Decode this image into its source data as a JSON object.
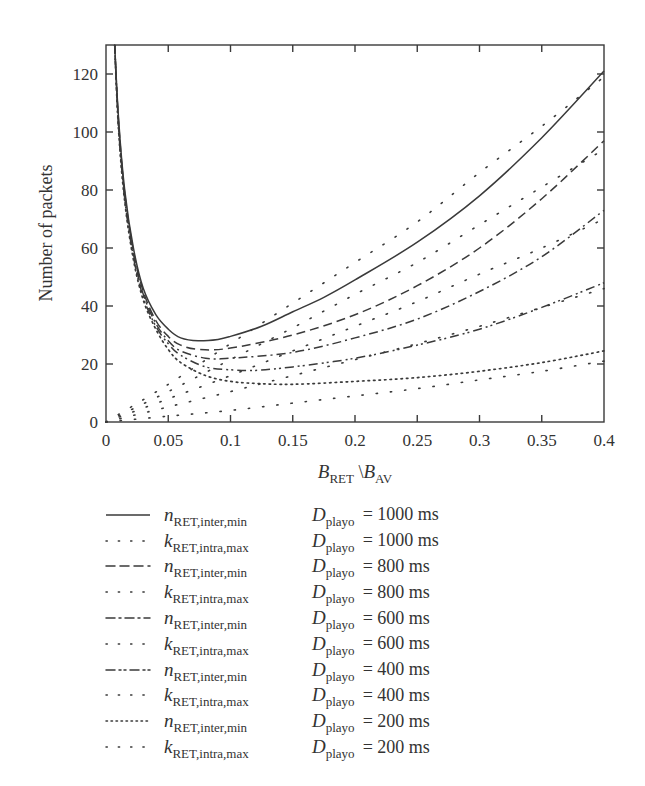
{
  "chart_data": {
    "type": "line",
    "title": "",
    "xlabel": "B_RET \\ B_AV",
    "xlabel_parts": {
      "b1": "B",
      "s1": "RET",
      "sep": " \\",
      "b2": "B",
      "s2": "AV"
    },
    "ylabel": "Number of packets",
    "xlim": [
      0,
      0.4
    ],
    "ylim": [
      0,
      130
    ],
    "x_ticks": [
      0,
      0.05,
      0.1,
      0.15,
      0.2,
      0.25,
      0.3,
      0.35,
      0.4
    ],
    "x_tick_labels": [
      "0",
      "0.05",
      "0.1",
      "0.15",
      "0.2",
      "0.25",
      "0.3",
      "0.35",
      "0.4"
    ],
    "y_ticks": [
      0,
      20,
      40,
      60,
      80,
      100,
      120
    ],
    "y_tick_labels": [
      "0",
      "20",
      "40",
      "60",
      "80",
      "100",
      "120"
    ],
    "grid": false,
    "legend_position": "below",
    "series": [
      {
        "name": "n_RET,inter,min D_playo = 1000 ms",
        "style": "solid",
        "x": [
          0.007,
          0.01,
          0.015,
          0.022,
          0.03,
          0.04,
          0.05,
          0.06,
          0.074,
          0.09,
          0.1,
          0.125,
          0.15,
          0.175,
          0.2,
          0.25,
          0.3,
          0.35,
          0.4
        ],
        "y": [
          130,
          105,
          80,
          60,
          46,
          37,
          32,
          29,
          28,
          28.5,
          29.5,
          33,
          38,
          43,
          49,
          62,
          78,
          98,
          121
        ]
      },
      {
        "name": "k_RET,intra,max D_playo = 1000 ms",
        "style": "sparse-dot",
        "x": [
          0,
          0.05,
          0.1,
          0.15,
          0.2,
          0.25,
          0.3,
          0.35,
          0.4
        ],
        "y": [
          0,
          13,
          27,
          41,
          55,
          69,
          86,
          102,
          119
        ]
      },
      {
        "name": "n_RET,inter,min D_playo = 800 ms",
        "style": "dashed",
        "x": [
          0.007,
          0.01,
          0.015,
          0.022,
          0.03,
          0.04,
          0.05,
          0.06,
          0.075,
          0.1,
          0.15,
          0.2,
          0.25,
          0.3,
          0.35,
          0.4
        ],
        "y": [
          130,
          104,
          79,
          59,
          45,
          35,
          29.5,
          26.5,
          25,
          25.5,
          30,
          37,
          47,
          60,
          77,
          97
        ]
      },
      {
        "name": "k_RET,intra,max D_playo = 800 ms",
        "style": "sparse-dot",
        "x": [
          0,
          0.05,
          0.1,
          0.15,
          0.2,
          0.25,
          0.3,
          0.35,
          0.4
        ],
        "y": [
          0,
          10.5,
          21.5,
          32.5,
          44,
          55,
          68,
          81,
          94
        ]
      },
      {
        "name": "n_RET,inter,min D_playo = 600 ms",
        "style": "dash-dot",
        "x": [
          0.007,
          0.01,
          0.015,
          0.022,
          0.03,
          0.04,
          0.05,
          0.06,
          0.08,
          0.1,
          0.15,
          0.2,
          0.25,
          0.3,
          0.35,
          0.4
        ],
        "y": [
          130,
          103,
          78,
          58,
          44,
          34,
          28,
          24.5,
          22,
          22,
          24,
          29,
          35.5,
          45,
          57,
          73
        ]
      },
      {
        "name": "k_RET,intra,max D_playo = 600 ms",
        "style": "sparse-dot",
        "x": [
          0,
          0.05,
          0.1,
          0.15,
          0.2,
          0.25,
          0.3,
          0.35,
          0.4
        ],
        "y": [
          0,
          8,
          16,
          24.5,
          33,
          41.5,
          51,
          60,
          70
        ]
      },
      {
        "name": "n_RET,inter,min D_playo = 400 ms",
        "style": "dash-dot-dot",
        "x": [
          0.007,
          0.01,
          0.015,
          0.022,
          0.03,
          0.04,
          0.05,
          0.06,
          0.08,
          0.1,
          0.12,
          0.15,
          0.2,
          0.25,
          0.3,
          0.35,
          0.4
        ],
        "y": [
          130,
          102,
          77,
          57,
          43,
          33,
          27,
          23,
          19,
          18,
          17.8,
          19,
          22,
          26.5,
          32,
          39.5,
          48
        ]
      },
      {
        "name": "k_RET,intra,max D_playo = 400 ms",
        "style": "sparse-dot",
        "x": [
          0,
          0.05,
          0.1,
          0.15,
          0.2,
          0.25,
          0.3,
          0.35,
          0.4
        ],
        "y": [
          0,
          5.2,
          10.5,
          16,
          21.5,
          27,
          33,
          39.5,
          46
        ]
      },
      {
        "name": "n_RET,inter,min D_playo = 200 ms",
        "style": "dotted",
        "x": [
          0.007,
          0.01,
          0.015,
          0.022,
          0.03,
          0.04,
          0.05,
          0.06,
          0.08,
          0.1,
          0.12,
          0.15,
          0.2,
          0.25,
          0.3,
          0.35,
          0.4
        ],
        "y": [
          130,
          101,
          76,
          56,
          42,
          32,
          25,
          20.5,
          16,
          14,
          13.3,
          13,
          14,
          15.3,
          17.5,
          20.5,
          24.5
        ]
      },
      {
        "name": "k_RET,intra,max D_playo = 200 ms",
        "style": "sparse-dot",
        "x": [
          0,
          0.05,
          0.1,
          0.15,
          0.2,
          0.25,
          0.3,
          0.35,
          0.4
        ],
        "y": [
          0,
          2,
          4,
          6.5,
          9,
          11.5,
          14.5,
          17.5,
          21
        ]
      }
    ]
  },
  "legend": {
    "items": [
      {
        "style": "solid",
        "sym": "n",
        "sub": "RET,inter,min",
        "d": "D",
        "dsub": "playo",
        "value": "= 1000 ms"
      },
      {
        "style": "sparse-dot",
        "sym": "k",
        "sub": "RET,intra,max",
        "d": "D",
        "dsub": "playo",
        "value": "= 1000 ms"
      },
      {
        "style": "dashed",
        "sym": "n",
        "sub": "RET,inter,min",
        "d": "D",
        "dsub": "playo",
        "value": "= 800 ms"
      },
      {
        "style": "sparse-dot",
        "sym": "k",
        "sub": "RET,intra,max",
        "d": "D",
        "dsub": "playo",
        "value": "= 800 ms"
      },
      {
        "style": "dash-dot",
        "sym": "n",
        "sub": "RET,inter,min",
        "d": "D",
        "dsub": "playo",
        "value": "= 600 ms"
      },
      {
        "style": "sparse-dot",
        "sym": "k",
        "sub": "RET,intra,max",
        "d": "D",
        "dsub": "playo",
        "value": "= 600 ms"
      },
      {
        "style": "dash-dot-dot",
        "sym": "n",
        "sub": "RET,inter,min",
        "d": "D",
        "dsub": "playo",
        "value": "= 400 ms"
      },
      {
        "style": "sparse-dot",
        "sym": "k",
        "sub": "RET,intra,max",
        "d": "D",
        "dsub": "playo",
        "value": "= 400 ms"
      },
      {
        "style": "dotted",
        "sym": "n",
        "sub": "RET,inter,min",
        "d": "D",
        "dsub": "playo",
        "value": "= 200 ms"
      },
      {
        "style": "sparse-dot",
        "sym": "k",
        "sub": "RET,intra,max",
        "d": "D",
        "dsub": "playo",
        "value": "= 200 ms"
      }
    ]
  },
  "colors": {
    "line": "#3a3a3a",
    "axis": "#3a3a3a",
    "text": "#333333",
    "background": "#ffffff"
  }
}
